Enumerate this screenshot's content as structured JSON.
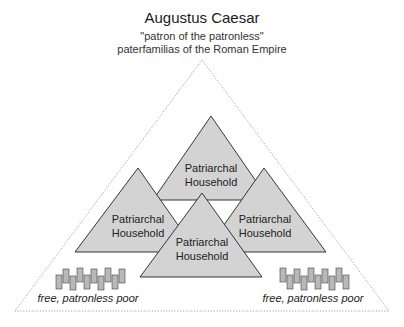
{
  "header": {
    "title": "Augustus Caesar",
    "subtitle1": "\"patron of the patronless\"",
    "subtitle2": "paterfamilias of the Roman Empire"
  },
  "households": [
    {
      "line1": "Patriarchal",
      "line2": "Household",
      "position": "top"
    },
    {
      "line1": "Patriarchal",
      "line2": "Household",
      "position": "left"
    },
    {
      "line1": "Patriarchal",
      "line2": "Household",
      "position": "right"
    },
    {
      "line1": "Patriarchal",
      "line2": "Household",
      "position": "center"
    }
  ],
  "poor_groups": [
    {
      "label": "free, patronless poor",
      "position": "left",
      "count": 10
    },
    {
      "label": "free, patronless poor",
      "position": "right",
      "count": 10
    }
  ],
  "colors": {
    "triangle_fill": "#d3d3d3",
    "triangle_stroke": "#222222",
    "outer_dotted": "#8a8a8a",
    "poor_fill": "#b8b8b8"
  }
}
